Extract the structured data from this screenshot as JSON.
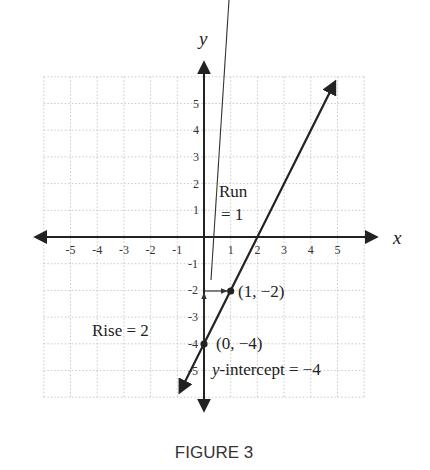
{
  "chart_data": {
    "type": "line",
    "title": "",
    "caption": "FIGURE 3",
    "xlabel": "x",
    "ylabel": "y",
    "xlim": [
      -6,
      6
    ],
    "ylim": [
      -6,
      6
    ],
    "grid": true,
    "x_ticks": [
      "-5",
      "-4",
      "-3",
      "-2",
      "-1",
      "1",
      "2",
      "3",
      "4",
      "5"
    ],
    "y_ticks": [
      "5",
      "4",
      "3",
      "2",
      "1",
      "-1",
      "-2",
      "-3",
      "-4",
      "-5"
    ],
    "series": [
      {
        "name": "y = 2x - 4",
        "slope": 2,
        "intercept": -4,
        "x": [
          -0.9,
          0,
          1,
          2,
          4.9
        ],
        "y": [
          -5.8,
          -4,
          -2,
          0,
          5.8
        ]
      }
    ],
    "points": [
      {
        "x": 0,
        "y": -4,
        "label": "(0, −4)"
      },
      {
        "x": 1,
        "y": -2,
        "label": "(1, −2)"
      }
    ],
    "annotations": {
      "run_label_line1": "Run",
      "run_label_line2": "= 1",
      "rise_label": "Rise = 2",
      "intercept_label_italic": "y",
      "intercept_label_rest": "-intercept = −4"
    }
  }
}
